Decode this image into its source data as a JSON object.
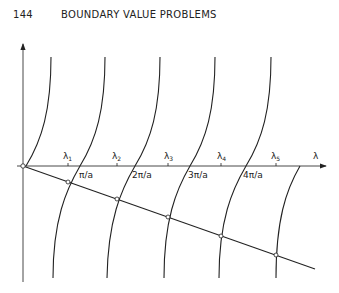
{
  "header": {
    "page_number": "144",
    "running_title": "BOUNDARY VALUE PROBLEMS"
  },
  "figure": {
    "axis_label": "λ",
    "lambda_labels": [
      "λ1",
      "λ2",
      "λ3",
      "λ4",
      "λ5"
    ],
    "lambda_subs": [
      "1",
      "2",
      "3",
      "4",
      "5"
    ],
    "pi_labels": [
      "π/a",
      "2π/a",
      "3π/a",
      "4π/a"
    ]
  }
}
